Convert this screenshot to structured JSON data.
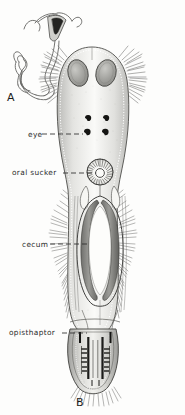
{
  "figure": {
    "kind": "scientific-illustration",
    "background_color": "#fdfdfc",
    "ink_color": "#2b2b2b",
    "width": 185,
    "height": 415
  },
  "panels": [
    {
      "letter": "A",
      "name": "panel-a-sclerotized-structure",
      "description": "detached sclerotized tubular organ with funnel-shaped proximal end and coiled distal tube"
    },
    {
      "letter": "B",
      "name": "panel-b-whole-worm",
      "description": "whole mount dorsal view of the worm body with marginal cilia"
    }
  ],
  "labels": [
    {
      "text": "eye",
      "name": "label-eye",
      "leader": "dashed"
    },
    {
      "text": "oral sucker",
      "name": "label-oral-sucker",
      "leader": "dashed"
    },
    {
      "text": "cecum",
      "name": "label-cecum",
      "leader": "dashed"
    },
    {
      "text": "opisthaptor",
      "name": "label-opisthaptor",
      "leader": "dashed"
    }
  ],
  "structures": {
    "eyespots_count": 4,
    "head_glands_count": 2,
    "oral_sucker_rays": 26,
    "ceca_count": 2,
    "haptor_clamp_pairs": 4
  }
}
